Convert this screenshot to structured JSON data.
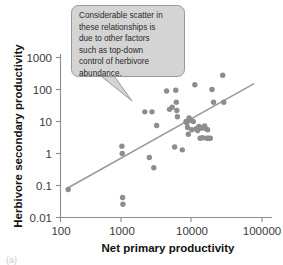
{
  "chart_data": {
    "type": "scatter",
    "title": "",
    "xlabel": "Net primary productivity",
    "ylabel": "Herbivore secondary productivity",
    "xscale": "log",
    "yscale": "log",
    "xlim": [
      100,
      100000
    ],
    "ylim": [
      0.01,
      1000
    ],
    "xticks": [
      100,
      1000,
      10000,
      100000
    ],
    "xtick_labels": [
      "100",
      "1000",
      "10000",
      "100000"
    ],
    "yticks": [
      0.01,
      0.1,
      1,
      10,
      100,
      1000
    ],
    "ytick_labels": [
      "0.01",
      "0.1",
      "1",
      "10",
      "100",
      "1000"
    ],
    "grid": false,
    "legend": false,
    "point_color": "#8d8d8d",
    "trendline_color": "#9a9a9a",
    "points": [
      {
        "x": 130,
        "y": 0.075
      },
      {
        "x": 820,
        "y": 1.7
      },
      {
        "x": 830,
        "y": 1.0
      },
      {
        "x": 840,
        "y": 0.042
      },
      {
        "x": 850,
        "y": 0.026
      },
      {
        "x": 1800,
        "y": 20
      },
      {
        "x": 2100,
        "y": 0.75
      },
      {
        "x": 2300,
        "y": 20
      },
      {
        "x": 2450,
        "y": 0.36
      },
      {
        "x": 2700,
        "y": 7.5
      },
      {
        "x": 3800,
        "y": 90
      },
      {
        "x": 4200,
        "y": 24
      },
      {
        "x": 4600,
        "y": 28
      },
      {
        "x": 5000,
        "y": 1.6
      },
      {
        "x": 5200,
        "y": 95
      },
      {
        "x": 5300,
        "y": 40
      },
      {
        "x": 5400,
        "y": 22
      },
      {
        "x": 5500,
        "y": 14
      },
      {
        "x": 6500,
        "y": 1.3
      },
      {
        "x": 7400,
        "y": 10
      },
      {
        "x": 7600,
        "y": 9
      },
      {
        "x": 7800,
        "y": 6.5
      },
      {
        "x": 8000,
        "y": 4.0
      },
      {
        "x": 8200,
        "y": 13
      },
      {
        "x": 8600,
        "y": 11
      },
      {
        "x": 9000,
        "y": 5.5
      },
      {
        "x": 9500,
        "y": 10
      },
      {
        "x": 10000,
        "y": 140
      },
      {
        "x": 10500,
        "y": 6.0
      },
      {
        "x": 11000,
        "y": 5.2
      },
      {
        "x": 11500,
        "y": 7.0
      },
      {
        "x": 12000,
        "y": 3.0
      },
      {
        "x": 12500,
        "y": 6.2
      },
      {
        "x": 13000,
        "y": 3.1
      },
      {
        "x": 13500,
        "y": 6.8
      },
      {
        "x": 14000,
        "y": 7.2
      },
      {
        "x": 14500,
        "y": 6.0
      },
      {
        "x": 15000,
        "y": 3.0
      },
      {
        "x": 15500,
        "y": 5.5
      },
      {
        "x": 16000,
        "y": 3.0
      },
      {
        "x": 17000,
        "y": 3.0
      },
      {
        "x": 18000,
        "y": 100
      },
      {
        "x": 19000,
        "y": 40
      },
      {
        "x": 26000,
        "y": 280
      },
      {
        "x": 27000,
        "y": 40
      }
    ],
    "trendline": {
      "x_start": 130,
      "y_start": 0.085,
      "x_end": 75000,
      "y_end": 150
    },
    "annotation": {
      "lines": [
        "Considerable scatter in",
        "these relationships is",
        "due to other factors",
        "such as top-down",
        "control of herbivore",
        "abundance."
      ],
      "full_text": "Considerable scatter in these relationships is due to other factors such as top-down control of herbivore abundance."
    }
  },
  "figure": {
    "corner_label": "(a)"
  }
}
